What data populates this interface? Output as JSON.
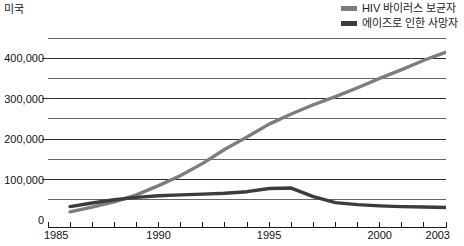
{
  "chart": {
    "title": "미국"
  },
  "legend": {
    "position": "top-right",
    "items": [
      {
        "label": "HIV 바이러스 보균자",
        "color": "#7d7d7d",
        "swatch_name": "legend-swatch-hiv"
      },
      {
        "label": "에이즈로 인한 사망자",
        "color": "#3c3c3c",
        "swatch_name": "legend-swatch-deaths"
      }
    ]
  },
  "axes": {
    "y_tick_labels": [
      "0",
      "100,000",
      "200,000",
      "300,000",
      "400,000"
    ],
    "x_tick_labels": [
      "1985",
      "1990",
      "1995",
      "2000",
      "2003"
    ]
  },
  "chart_data": {
    "type": "line",
    "title": "미국",
    "xlabel": "",
    "ylabel": "",
    "xlim": [
      1985,
      2003
    ],
    "ylim": [
      0,
      450000
    ],
    "y_major_ticks": [
      0,
      100000,
      200000,
      300000,
      400000
    ],
    "y_minor_ticks": [
      50000,
      150000,
      250000,
      350000,
      450000
    ],
    "y_tick_labels": [
      "0",
      "100,000",
      "200,000",
      "300,000",
      "400,000"
    ],
    "x_ticks": [
      1985,
      1986,
      1987,
      1988,
      1989,
      1990,
      1991,
      1992,
      1993,
      1994,
      1995,
      1996,
      1997,
      1998,
      1999,
      2000,
      2001,
      2002,
      2003
    ],
    "x_tick_labels": [
      "1985",
      "1990",
      "1995",
      "2000",
      "2003"
    ],
    "grid": true,
    "grid_axis": "y",
    "legend_position": "top-right",
    "x": [
      1986,
      1987,
      1988,
      1989,
      1990,
      1991,
      1992,
      1993,
      1994,
      1995,
      1996,
      1997,
      1998,
      1999,
      2000,
      2001,
      2002,
      2003
    ],
    "series": [
      {
        "name": "HIV 바이러스 보균자",
        "color": "#7d7d7d",
        "values": [
          20000,
          32000,
          45000,
          62000,
          85000,
          110000,
          140000,
          175000,
          205000,
          237000,
          262000,
          285000,
          305000,
          327000,
          350000,
          372000,
          395000,
          415000
        ]
      },
      {
        "name": "에이즈로 인한 사망자",
        "color": "#3c3c3c",
        "values": [
          33000,
          42000,
          50000,
          56000,
          60000,
          62000,
          64000,
          66000,
          70000,
          78000,
          79000,
          58000,
          43000,
          38000,
          35000,
          33000,
          32000,
          31000
        ]
      }
    ]
  }
}
